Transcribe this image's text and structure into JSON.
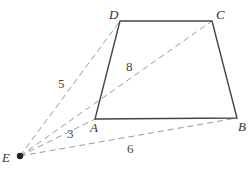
{
  "diagram": {
    "type": "geometry",
    "colors": {
      "edge": "#444444",
      "dashed": "#9a9a9a",
      "point": "#222222",
      "text": "#333333"
    },
    "points": {
      "A": {
        "label": "A",
        "x": 95,
        "y": 119
      },
      "B": {
        "label": "B",
        "x": 237,
        "y": 118
      },
      "C": {
        "label": "C",
        "x": 212,
        "y": 21
      },
      "D": {
        "label": "D",
        "x": 120,
        "y": 21
      },
      "E": {
        "label": "E",
        "x": 20,
        "y": 156
      }
    },
    "polygon": [
      "A",
      "B",
      "C",
      "D"
    ],
    "segments": [
      {
        "from": "E",
        "to": "D",
        "length": "5"
      },
      {
        "from": "E",
        "to": "C",
        "length": "8"
      },
      {
        "from": "E",
        "to": "A",
        "length": "3"
      },
      {
        "from": "E",
        "to": "B",
        "length": "6"
      }
    ],
    "length_labels": {
      "ED": "5",
      "EC": "8",
      "EA": "3",
      "EB": "6"
    }
  }
}
